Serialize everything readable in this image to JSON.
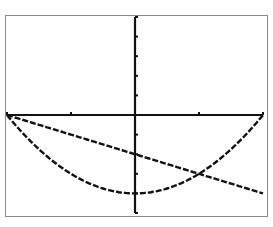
{
  "chart_data": {
    "type": "line",
    "title": "",
    "xlabel": "",
    "ylabel": "",
    "xlim": [
      -2,
      2
    ],
    "ylim": [
      -5,
      5
    ],
    "x_tick_spacing": 1,
    "y_tick_spacing": 1,
    "grid": false,
    "legend": null,
    "series": [
      {
        "name": "parabola",
        "equation": "y = x^2 - 4",
        "x": [
          -2,
          -1.5,
          -1,
          -0.5,
          0,
          0.5,
          1,
          1.5,
          2
        ],
        "y": [
          0,
          -1.75,
          -3,
          -3.75,
          -4,
          -3.75,
          -3,
          -1.75,
          0
        ]
      },
      {
        "name": "line",
        "equation": "y = -x - 2",
        "x": [
          -2,
          -1,
          0,
          1,
          2
        ],
        "y": [
          0,
          -1,
          -2,
          -3,
          -4
        ]
      }
    ],
    "annotations": [
      {
        "type": "intersection",
        "x": -2,
        "y": 0
      },
      {
        "type": "intersection",
        "x": 1,
        "y": -3
      }
    ]
  },
  "colors": {
    "ink": "#111111",
    "frame": "#8a8a8a",
    "background": "#ffffff"
  }
}
